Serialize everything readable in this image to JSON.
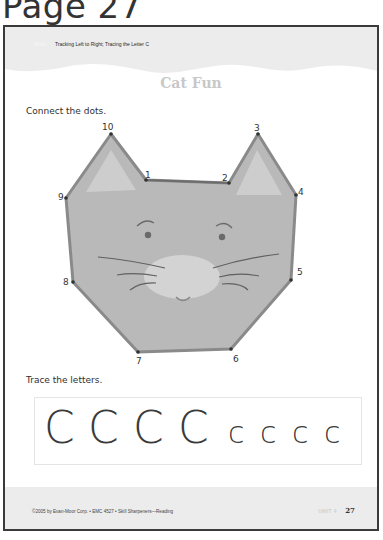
{
  "page_label": "Page 27",
  "header": {
    "skill_tag": "Skills",
    "subtitle": "Tracking Left to Right; Tracing the Letter C"
  },
  "title": "Cat Fun",
  "activity1": {
    "instruction": "Connect the dots.",
    "dots": [
      {
        "n": "1",
        "x": 146,
        "y": 180
      },
      {
        "n": "2",
        "x": 229,
        "y": 183
      },
      {
        "n": "3",
        "x": 258,
        "y": 134
      },
      {
        "n": "4",
        "x": 296,
        "y": 195
      },
      {
        "n": "5",
        "x": 291,
        "y": 280
      },
      {
        "n": "6",
        "x": 231,
        "y": 349
      },
      {
        "n": "7",
        "x": 138,
        "y": 352
      },
      {
        "n": "8",
        "x": 73,
        "y": 282
      },
      {
        "n": "9",
        "x": 66,
        "y": 198
      },
      {
        "n": "10",
        "x": 111,
        "y": 134
      }
    ]
  },
  "activity2": {
    "instruction": "Trace the letters.",
    "letters": [
      "C",
      "C",
      "C",
      "C",
      "c",
      "c",
      "c",
      "c"
    ]
  },
  "footer": {
    "copyright": "©2005 by Evan-Moor Corp. • EMC 4527 • Skill Sharpeners—Reading",
    "unit": "UNIT 4",
    "page_number": "27"
  },
  "colors": {
    "frame": "#3a3a3a",
    "cat_fill": "#b9b9b9",
    "cat_outline": "#8a8a8a",
    "ear_inner": "#cfcfcf",
    "muzzle": "#d3d3d3",
    "band": "#ececec"
  }
}
